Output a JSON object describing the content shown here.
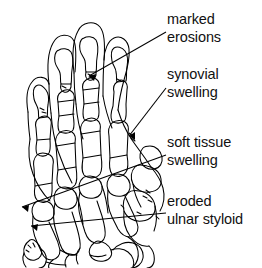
{
  "figure": {
    "kind": "annotated-line-drawing",
    "background_color": "#ffffff",
    "ink_color": "#000000"
  },
  "annotations": [
    {
      "id": "marked-erosions",
      "line1": "marked",
      "line2": "erosions",
      "leader": {
        "from_x": 166,
        "from_y": 32,
        "to_x": 87,
        "to_y": 77
      }
    },
    {
      "id": "synovial-swelling",
      "line1": "synovial",
      "line2": "swelling",
      "leader": {
        "from_x": 166,
        "from_y": 88,
        "to_x": 127,
        "to_y": 137
      }
    },
    {
      "id": "soft-tissue-swelling",
      "line1": "soft tissue",
      "line2": "swelling",
      "leader": {
        "from_x": 166,
        "from_y": 155,
        "to_x": 20,
        "to_y": 208
      }
    },
    {
      "id": "eroded-ulnar-styloid",
      "line1": "eroded",
      "line2": "ulnar styloid",
      "leader": {
        "from_x": 166,
        "from_y": 213,
        "to_x": 29,
        "to_y": 227
      }
    }
  ]
}
